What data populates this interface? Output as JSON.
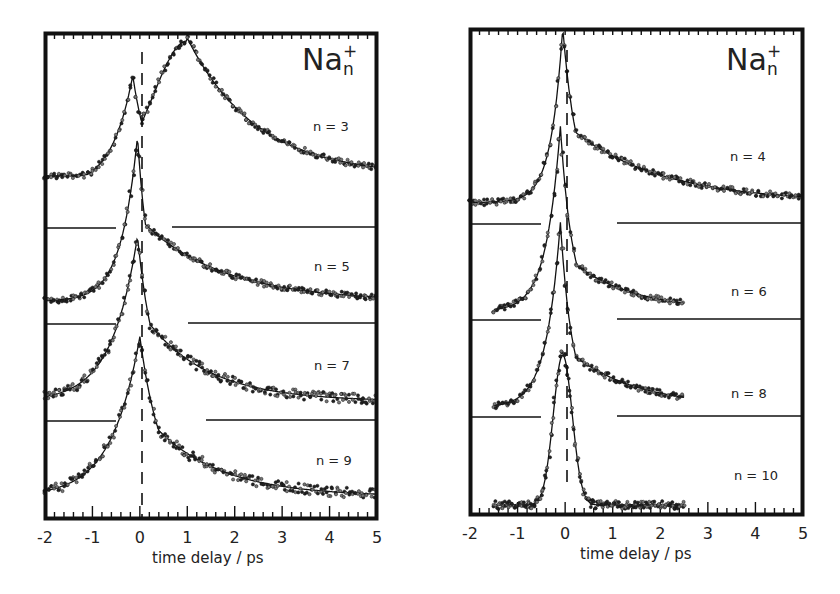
{
  "chart_data": [
    {
      "type": "line",
      "panel": "left",
      "title": "Na_n^+",
      "title_main": "Na",
      "title_sup": "+",
      "title_sub": "n",
      "xlabel": "time delay / ps",
      "ylabel": "",
      "xlim": [
        -2,
        5
      ],
      "xticks": [
        "-2",
        "-1",
        "0",
        "1",
        "2",
        "3",
        "4",
        "5"
      ],
      "grid": false,
      "legend": "none",
      "annotations": [
        "vertical dashed line at t = 0",
        "horizontal baselines separate stacked traces"
      ],
      "series": [
        {
          "name": "n = 3",
          "label": "n = 3",
          "peak_time_ps": 1.0,
          "shoulder_time_ps": -0.2,
          "decay": "slow, extends to 5 ps",
          "x": [
            -2,
            -1,
            -0.5,
            -0.2,
            0,
            0.5,
            1,
            2,
            3,
            4,
            5
          ],
          "y_rel": [
            0.08,
            0.3,
            0.6,
            0.78,
            0.78,
            0.95,
            1.0,
            0.75,
            0.45,
            0.2,
            0.08
          ]
        },
        {
          "name": "n = 5",
          "label": "n = 5",
          "peak_time_ps": -0.05,
          "decay": "fast spike then slow tail",
          "x": [
            -2,
            -1,
            -0.5,
            -0.1,
            0.3,
            1,
            2,
            3,
            4,
            5
          ],
          "y_rel": [
            0.1,
            0.2,
            0.45,
            1.0,
            0.55,
            0.5,
            0.33,
            0.18,
            0.08,
            0.04
          ]
        },
        {
          "name": "n = 7",
          "label": "n = 7",
          "peak_time_ps": -0.05,
          "decay": "exponential tail",
          "x": [
            -2,
            -1,
            -0.5,
            -0.05,
            0.5,
            1,
            2,
            3,
            4,
            5
          ],
          "y_rel": [
            0.08,
            0.25,
            0.5,
            1.0,
            0.6,
            0.45,
            0.25,
            0.1,
            0.05,
            0.04
          ]
        },
        {
          "name": "n = 9",
          "label": "n = 9",
          "peak_time_ps": 0.0,
          "decay": "exponential tail",
          "x": [
            -2,
            -1,
            -0.5,
            0,
            0.5,
            1,
            2,
            3,
            4,
            5
          ],
          "y_rel": [
            0.05,
            0.3,
            0.55,
            1.0,
            0.6,
            0.45,
            0.25,
            0.12,
            0.07,
            0.05
          ]
        }
      ]
    },
    {
      "type": "line",
      "panel": "right",
      "title": "Na_n^+",
      "title_main": "Na",
      "title_sup": "+",
      "title_sub": "n",
      "xlabel": "time delay / ps",
      "ylabel": "",
      "xlim": [
        -2,
        5
      ],
      "xticks": [
        "-2",
        "-1",
        "0",
        "1",
        "2",
        "3",
        "4",
        "5"
      ],
      "grid": false,
      "legend": "none",
      "annotations": [
        "vertical dashed line at t = 0",
        "horizontal baselines separate stacked traces"
      ],
      "series": [
        {
          "name": "n = 4",
          "label": "n = 4",
          "peak_time_ps": -0.05,
          "decay": "slow tail to 5 ps",
          "x": [
            -2,
            -1,
            -0.5,
            -0.05,
            0.5,
            1,
            2,
            3,
            4,
            5
          ],
          "y_rel": [
            0.05,
            0.1,
            0.25,
            1.0,
            0.6,
            0.45,
            0.3,
            0.18,
            0.1,
            0.05
          ]
        },
        {
          "name": "n = 6",
          "label": "n = 6",
          "peak_time_ps": -0.1,
          "decay": "data to 2.5 ps",
          "x": [
            -1.5,
            -1,
            -0.5,
            -0.1,
            0.5,
            1,
            2,
            2.5
          ],
          "y_rel": [
            0.05,
            0.15,
            0.4,
            1.0,
            0.35,
            0.22,
            0.1,
            0.05
          ]
        },
        {
          "name": "n = 8",
          "label": "n = 8",
          "peak_time_ps": -0.1,
          "decay": "data to 2.5 ps",
          "x": [
            -1.5,
            -1,
            -0.5,
            -0.1,
            0.5,
            1,
            2,
            2.5
          ],
          "y_rel": [
            0.05,
            0.15,
            0.4,
            1.0,
            0.35,
            0.25,
            0.12,
            0.05
          ]
        },
        {
          "name": "n = 10",
          "label": "n = 10",
          "peak_time_ps": -0.05,
          "decay": "very fast, near-symmetric spike",
          "x": [
            -1.5,
            -1,
            -0.5,
            -0.2,
            -0.05,
            0.2,
            0.5,
            1,
            2,
            2.5
          ],
          "y_rel": [
            0.05,
            0.05,
            0.1,
            0.5,
            1.0,
            0.6,
            0.2,
            0.03,
            0.03,
            0.02
          ]
        }
      ]
    }
  ],
  "figure": {
    "left": {
      "species_main": "Na",
      "species_sup": "+",
      "species_sub": "n",
      "labels": [
        "n = 3",
        "n = 5",
        "n = 7",
        "n = 9"
      ],
      "xticks": [
        "-2",
        "-1",
        "0",
        "1",
        "2",
        "3",
        "4",
        "5"
      ],
      "xlabel": "time delay / ps"
    },
    "right": {
      "species_main": "Na",
      "species_sup": "+",
      "species_sub": "n",
      "labels": [
        "n = 4",
        "n = 6",
        "n = 8",
        "n = 10"
      ],
      "xticks": [
        "-2",
        "-1",
        "0",
        "1",
        "2",
        "3",
        "4",
        "5"
      ],
      "xlabel": "time delay / ps"
    }
  }
}
